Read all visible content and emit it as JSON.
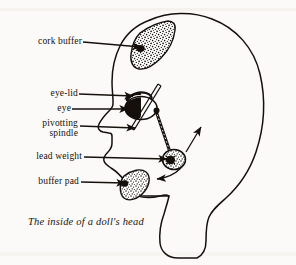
{
  "figure": {
    "caption": "The inside of a doll's head",
    "title": "The inside of a doll's head",
    "background_color": "#fbfaf8",
    "ink_color": "#15100c"
  },
  "labels": [
    {
      "id": "cork-buffer",
      "text": "cork buffer",
      "line2": "",
      "x": 14,
      "y": 37,
      "leader_from_x": 83,
      "leader_from_y": 42,
      "leader_to_x": 140,
      "leader_to_y": 48
    },
    {
      "id": "eye-lid",
      "text": "eye-lid",
      "line2": "",
      "x": 38,
      "y": 89,
      "leader_from_x": 79,
      "leader_from_y": 94,
      "leader_to_x": 132,
      "leader_to_y": 96
    },
    {
      "id": "eye",
      "text": "eye",
      "line2": "",
      "x": 53,
      "y": 104,
      "leader_from_x": 72,
      "leader_from_y": 109,
      "leader_to_x": 127,
      "leader_to_y": 110
    },
    {
      "id": "pivotting-spindle",
      "text": "pivotting",
      "line2": "spindle",
      "x": 28,
      "y": 122,
      "leader_from_x": 80,
      "leader_from_y": 126,
      "leader_to_x": 134,
      "leader_to_y": 128
    },
    {
      "id": "lead-weight",
      "text": "lead weight",
      "line2": "",
      "x": 15,
      "y": 152,
      "leader_from_x": 84,
      "leader_from_y": 157,
      "leader_to_x": 166,
      "leader_to_y": 160
    },
    {
      "id": "buffer-pad",
      "text": "buffer pad",
      "line2": "",
      "x": 20,
      "y": 177,
      "leader_from_x": 81,
      "leader_from_y": 182,
      "leader_to_x": 124,
      "leader_to_y": 183
    }
  ],
  "parts": {
    "cork_buffer_name": "cork buffer",
    "eye_lid_name": "eye-lid",
    "eye_name": "eye",
    "pivotting_spindle_name": "pivotting spindle",
    "lead_weight_name": "lead weight",
    "buffer_pad_name": "buffer pad",
    "head_outline_name": "doll head profile outline",
    "motion_arrow_up_name": "motion arrow up-right",
    "motion_arrow_down_name": "motion arrow down-left"
  }
}
